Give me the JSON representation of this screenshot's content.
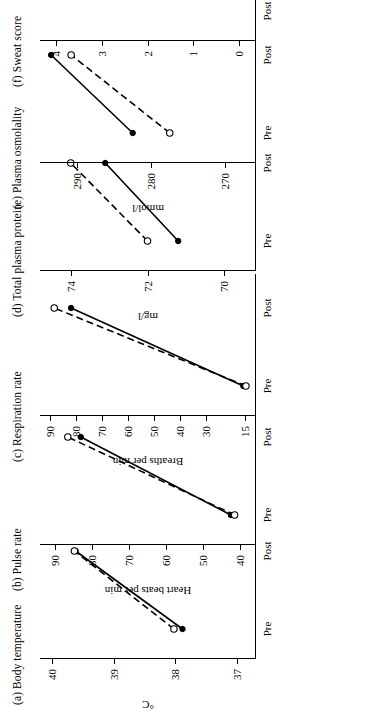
{
  "figure": {
    "orientation": "rotated-90-ccw",
    "x_categories": [
      "Pre",
      "Post"
    ],
    "series_names": [
      "solid-filled",
      "dashed-open"
    ]
  },
  "panels": [
    {
      "key": "a",
      "tag": "(a)",
      "title": "(a)  Body temperature",
      "title_line2": "",
      "ylabel": "°C",
      "yticks": [
        "40",
        "39",
        "38",
        "37"
      ],
      "ytick_values": [
        40,
        39,
        38,
        37
      ],
      "ymin": 36.7,
      "ymax": 40.2,
      "xcats": [
        "Pre",
        "Post"
      ],
      "series": [
        {
          "name": "solid-filled",
          "style": "solid",
          "marker": "filled",
          "values": [
            37.88,
            39.62
          ]
        },
        {
          "name": "dashed-open",
          "style": "dashed",
          "marker": "open",
          "values": [
            38.02,
            39.64
          ]
        }
      ]
    },
    {
      "key": "b",
      "tag": "(b)",
      "title": "(b)  Pulse rate",
      "title_line2": "",
      "ylabel": "Heart beats per min",
      "yticks": [
        "90",
        "80",
        "70",
        "60",
        "50",
        "40"
      ],
      "ytick_values": [
        90,
        80,
        70,
        60,
        50,
        40
      ],
      "ymin": 36,
      "ymax": 94,
      "xcats": [
        "Pre",
        "Post"
      ],
      "series": [
        {
          "name": "solid-filled",
          "style": "solid",
          "marker": "filled",
          "values": [
            42.5,
            83.0
          ]
        },
        {
          "name": "dashed-open",
          "style": "dashed",
          "marker": "open",
          "values": [
            41.5,
            86.5
          ]
        }
      ]
    },
    {
      "key": "c",
      "tag": "(c)",
      "title": "(c)  Respiration rate",
      "title_line2": "",
      "ylabel": "Breaths per min",
      "yticks": [
        "90",
        "80",
        "70",
        "60",
        "50",
        "40",
        "30",
        "15"
      ],
      "ytick_values": [
        90,
        80,
        70,
        60,
        50,
        40,
        30,
        15
      ],
      "ymin": 11,
      "ymax": 94,
      "xcats": [
        "Pre",
        "Post"
      ],
      "series": [
        {
          "name": "solid-filled",
          "style": "solid",
          "marker": "filled",
          "values": [
            15.5,
            82.0
          ]
        },
        {
          "name": "dashed-open",
          "style": "dashed",
          "marker": "open",
          "values": [
            14.5,
            88.5
          ]
        }
      ]
    },
    {
      "key": "d",
      "tag": "(d)",
      "title": "(d)  Total plasma protein",
      "title_line2": "",
      "ylabel": "mg/l",
      "yticks": [
        "74",
        "72",
        "70"
      ],
      "ytick_values": [
        74,
        72,
        70
      ],
      "ymin": 69.2,
      "ymax": 74.8,
      "xcats": [
        "Pre",
        "Post"
      ],
      "series": [
        {
          "name": "solid-filled",
          "style": "solid",
          "marker": "filled",
          "values": [
            71.2,
            73.1
          ]
        },
        {
          "name": "dashed-open",
          "style": "dashed",
          "marker": "open",
          "values": [
            72.0,
            74.0
          ]
        }
      ]
    },
    {
      "key": "e",
      "tag": "(e)",
      "title": "(e)  Plasma osmolality",
      "title_line2": "(dehydration)",
      "ylabel": "mmol/l",
      "yticks": [
        "290",
        "280",
        "270"
      ],
      "ytick_values": [
        290,
        280,
        270
      ],
      "ymin": 266,
      "ymax": 295,
      "xcats": [
        "Pre",
        "Post"
      ],
      "series": [
        {
          "name": "solid-filled",
          "style": "solid",
          "marker": "filled",
          "values": [
            282.5,
            293.5
          ]
        },
        {
          "name": "dashed-open",
          "style": "dashed",
          "marker": "open",
          "values": [
            277.5,
            290.8
          ]
        }
      ]
    },
    {
      "key": "f",
      "tag": "(f)",
      "title": "(f)  Sweat score",
      "title_line2": "",
      "ylabel": "",
      "yticks": [
        "4",
        "3",
        "2",
        "1",
        "0"
      ],
      "ytick_values": [
        4,
        3,
        2,
        1,
        0
      ],
      "ymin": -0.35,
      "ymax": 4.35,
      "xcats": [
        "Post"
      ],
      "series": [
        {
          "name": "solid-filled",
          "style": "none",
          "marker": "filled",
          "values": [
            3.0
          ]
        },
        {
          "name": "dashed-open",
          "style": "none",
          "marker": "open",
          "values": [
            3.55
          ]
        }
      ]
    }
  ],
  "chart_data": {
    "type": "line",
    "subtitle": "",
    "layout": "six panels (a)-(f), figure printed rotated 90° counter-clockwise",
    "x": [
      "Pre",
      "Post"
    ],
    "xlabel": "",
    "legend": [
      "solid line with filled circles",
      "dashed line with open circles"
    ],
    "legend_position": "none",
    "grid": false,
    "panels": [
      {
        "panel": "(a)",
        "title": "Body temperature",
        "ylabel": "°C",
        "ylim": [
          36.7,
          40.2
        ],
        "yticks": [
          40,
          39,
          38,
          37
        ],
        "categories": [
          "Pre",
          "Post"
        ],
        "series": [
          {
            "name": "solid-filled",
            "values": [
              37.9,
              39.6
            ]
          },
          {
            "name": "dashed-open",
            "values": [
              38.0,
              39.6
            ]
          }
        ]
      },
      {
        "panel": "(b)",
        "title": "Pulse rate",
        "ylabel": "Heart beats per min",
        "ylim": [
          36,
          94
        ],
        "yticks": [
          90,
          80,
          70,
          60,
          50,
          40
        ],
        "categories": [
          "Pre",
          "Post"
        ],
        "series": [
          {
            "name": "solid-filled",
            "values": [
              42.5,
              83
            ]
          },
          {
            "name": "dashed-open",
            "values": [
              41.5,
              86.5
            ]
          }
        ]
      },
      {
        "panel": "(c)",
        "title": "Respiration rate",
        "ylabel": "Breaths per min",
        "ylim": [
          11,
          94
        ],
        "yticks": [
          90,
          80,
          70,
          60,
          50,
          40,
          30,
          15
        ],
        "categories": [
          "Pre",
          "Post"
        ],
        "series": [
          {
            "name": "solid-filled",
            "values": [
              15.5,
              82
            ]
          },
          {
            "name": "dashed-open",
            "values": [
              14.5,
              88.5
            ]
          }
        ]
      },
      {
        "panel": "(d)",
        "title": "Total plasma protein",
        "ylabel": "mg/l",
        "ylim": [
          69.2,
          74.8
        ],
        "yticks": [
          74,
          72,
          70
        ],
        "categories": [
          "Pre",
          "Post"
        ],
        "series": [
          {
            "name": "solid-filled",
            "values": [
              71.2,
              73.1
            ]
          },
          {
            "name": "dashed-open",
            "values": [
              72.0,
              74.0
            ]
          }
        ]
      },
      {
        "panel": "(e)",
        "title": "Plasma osmolality (dehydration)",
        "ylabel": "mmol/l",
        "ylim": [
          266,
          295
        ],
        "yticks": [
          290,
          280,
          270
        ],
        "categories": [
          "Pre",
          "Post"
        ],
        "series": [
          {
            "name": "solid-filled",
            "values": [
              282.5,
              293.5
            ]
          },
          {
            "name": "dashed-open",
            "values": [
              277.5,
              290.8
            ]
          }
        ]
      },
      {
        "panel": "(f)",
        "title": "Sweat score",
        "ylabel": "",
        "ylim": [
          -0.35,
          4.35
        ],
        "yticks": [
          4,
          3,
          2,
          1,
          0
        ],
        "categories": [
          "Post"
        ],
        "series": [
          {
            "name": "solid-filled",
            "values": [
              3.0
            ]
          },
          {
            "name": "dashed-open",
            "values": [
              3.55
            ]
          }
        ]
      }
    ]
  }
}
